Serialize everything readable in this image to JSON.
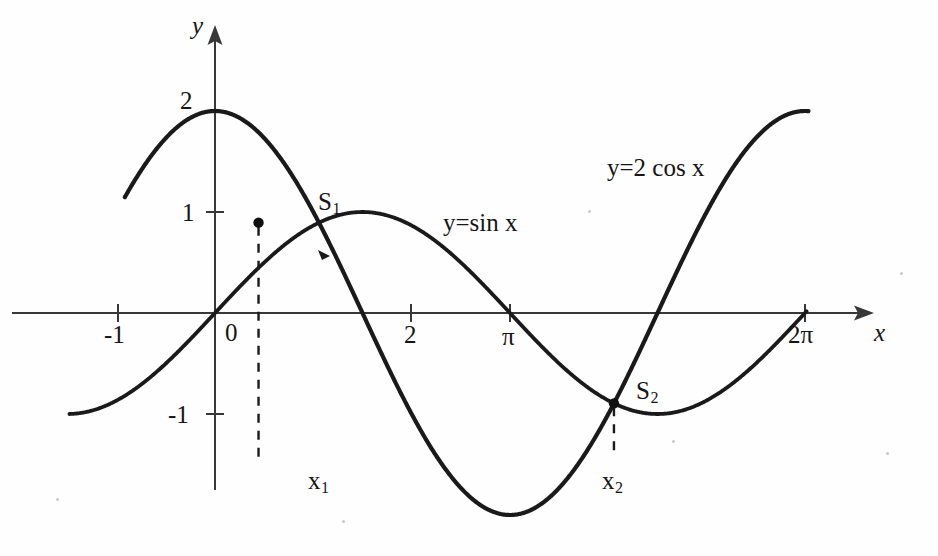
{
  "figure": {
    "kind": "mathematical-function-plot",
    "background_color": "#fefefe",
    "ink_color": "#151515"
  },
  "axes": {
    "x_axis_label": "x",
    "y_axis_label": "y",
    "origin_label": "0",
    "x_ticks": [
      {
        "label": "-1",
        "value": -1
      },
      {
        "label": "2",
        "value": 2
      },
      {
        "label": "π",
        "value": 3.14159
      },
      {
        "label": "2π",
        "value": 6.28319
      }
    ],
    "y_ticks": [
      {
        "label": "2",
        "value": 2
      },
      {
        "label": "1",
        "value": 1
      },
      {
        "label": "-1",
        "value": -1
      }
    ],
    "xlim": [
      -1.55,
      7.2
    ],
    "ylim": [
      -2.4,
      2.85
    ],
    "grid": false,
    "arrows": [
      "x-positive",
      "y-positive"
    ]
  },
  "curves": {
    "sine": {
      "label": "y=sin x",
      "expression": "sin(x)",
      "amplitude": 1
    },
    "cosine": {
      "label": "y=2 cos x",
      "expression": "2*cos(x)",
      "amplitude": 2
    }
  },
  "points": {
    "s1": {
      "label": "S",
      "sub": "1",
      "x_label": "x",
      "x_sub": "1",
      "x": 0.4636,
      "y": 0.8944
    },
    "s2": {
      "label": "S",
      "sub": "2",
      "x_label": "x",
      "x_sub": "2",
      "x": 4.2487,
      "y": -0.8944
    }
  },
  "chart_data": {
    "type": "line",
    "title": "",
    "xlabel": "x",
    "ylabel": "y",
    "xlim": [
      -1.55,
      7.2
    ],
    "ylim": [
      -2.4,
      2.85
    ],
    "grid": false,
    "legend": "inline-curve-labels",
    "xticks": [
      -1,
      2,
      3.14159,
      6.28319
    ],
    "xticklabels": [
      "-1",
      "2",
      "π",
      "2π"
    ],
    "yticks": [
      -1,
      1,
      2
    ],
    "yticklabels": [
      "-1",
      "1",
      "2"
    ],
    "series": [
      {
        "name": "y=sin x",
        "expression": "sin(x)",
        "x_domain": [
          -1.55,
          6.3
        ],
        "key_points": [
          {
            "x": -1.55,
            "y": -1.0
          },
          {
            "x": -0.785,
            "y": -0.707
          },
          {
            "x": 0,
            "y": 0
          },
          {
            "x": 1.5708,
            "y": 1
          },
          {
            "x": 3.14159,
            "y": 0
          },
          {
            "x": 4.7124,
            "y": -1
          },
          {
            "x": 6.28319,
            "y": 0
          }
        ]
      },
      {
        "name": "y=2 cos x",
        "expression": "2*cos(x)",
        "x_domain": [
          -0.96,
          6.32
        ],
        "key_points": [
          {
            "x": -0.96,
            "y": 1.146
          },
          {
            "x": 0,
            "y": 2
          },
          {
            "x": 1.5708,
            "y": 0
          },
          {
            "x": 3.14159,
            "y": -2
          },
          {
            "x": 4.7124,
            "y": 0
          },
          {
            "x": 6.28319,
            "y": 2
          }
        ]
      }
    ],
    "annotations": [
      {
        "text": "S₁",
        "x": 0.4636,
        "y": 0.8944,
        "note": "intersection point 1, marked with dot and dashed drop line to x₁"
      },
      {
        "text": "S₂",
        "x": 4.2487,
        "y": -0.8944,
        "note": "intersection point 2, marked with dot and dashed drop line to x₂"
      },
      {
        "text": "x₁",
        "x": 0.4636,
        "y": -1.75,
        "note": "x-coordinate label of S₁"
      },
      {
        "text": "x₂",
        "x": 4.2487,
        "y": -1.75,
        "note": "x-coordinate label of S₂"
      },
      {
        "text": "y=sin x",
        "x": 2.45,
        "y": 0.95,
        "note": "curve label for sine"
      },
      {
        "text": "y=2 cos x",
        "x": 4.2,
        "y": 1.45,
        "note": "curve label for scaled cosine"
      }
    ]
  }
}
